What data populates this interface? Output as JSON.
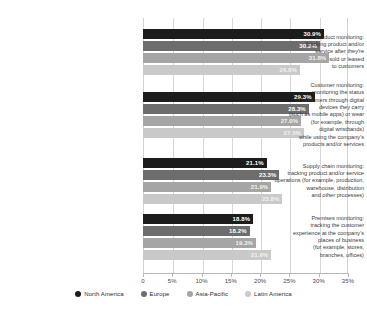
{
  "chart_data": {
    "type": "bar",
    "orientation": "horizontal",
    "title": "",
    "xlabel": "",
    "ylabel": "",
    "xlim": [
      0,
      35
    ],
    "grid": true,
    "legend_position": "bottom",
    "tick_labels": [
      "0",
      "5%",
      "10%",
      "15%",
      "20%",
      "25%",
      "30%",
      "35%"
    ],
    "tick_values": [
      0,
      5,
      10,
      15,
      20,
      25,
      30,
      35
    ],
    "categories": [
      "Product monitoring: Tracking product and/or service after they're sold or leased to customers",
      "Customer monitoring: monitoring the status of customers through digital devices they carry (such as mobile apps) or wear (for example, through digital wristbands) while using the company's products and/or services",
      "Supply chain monitoring: tracking product and/or service operations (for example, production, warehouse, distribution and other processes)",
      "Premises monitoring: tracking the customer experience at the company's places of business (for example, stores, branches, offices)"
    ],
    "category_label_lines": [
      [
        "Product monitoring:",
        "Tracking product and/or",
        "service after they're",
        "sold or leased",
        "to customers"
      ],
      [
        "Customer monitoring:",
        "monitoring the status",
        "of customers through digital",
        "devices they carry",
        "(such as mobile apps) or wear",
        "(for example, through",
        "digital wristbands)",
        "while using the company's",
        "products and/or services"
      ],
      [
        "Supply chain monitoring:",
        "tracking  product and/or service",
        "operations (for example, production,",
        "warehouse, distribution",
        "and other processes)"
      ],
      [
        "Premises monitoring:",
        "tracking the customer",
        "experience at the company's",
        "places of business",
        "(for example, stores,",
        "branches, offices)"
      ]
    ],
    "series": [
      {
        "name": "North America",
        "color": "#1c1c1c",
        "values": [
          30.9,
          29.3,
          21.1,
          18.8
        ],
        "labels": [
          "30.9%",
          "29.3%",
          "21.1%",
          "18.8%"
        ]
      },
      {
        "name": "Europe",
        "color": "#6d6d6d",
        "values": [
          30.2,
          28.3,
          23.3,
          18.2
        ],
        "labels": [
          "30.2%",
          "28.3%",
          "23.3%",
          "18.2%"
        ]
      },
      {
        "name": "Asia-Pacific",
        "color": "#a5a5a5",
        "values": [
          31.8,
          27.0,
          21.9,
          19.3
        ],
        "labels": [
          "31.8%",
          "27.0%",
          "21.9%",
          "19.3%"
        ]
      },
      {
        "name": "Latin America",
        "color": "#c9c9c9",
        "values": [
          26.8,
          27.5,
          23.8,
          21.9
        ],
        "labels": [
          "26.8%",
          "27.5%",
          "23.8%",
          "21.9%"
        ]
      }
    ]
  }
}
